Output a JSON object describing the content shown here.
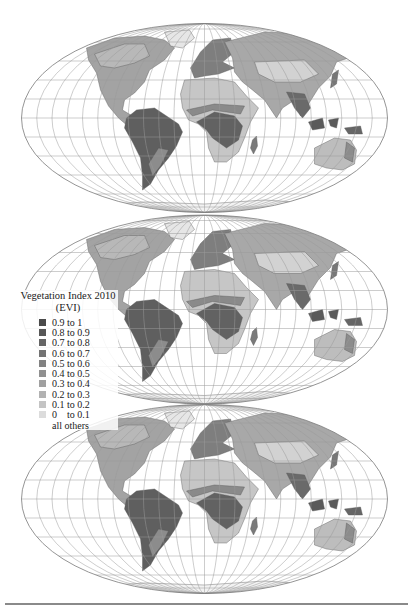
{
  "figure": {
    "maps": [
      {
        "id": "map-1",
        "cx": 204.5,
        "cy": 118,
        "rx": 183,
        "ry": 94
      },
      {
        "id": "map-2",
        "cx": 204.5,
        "cy": 309.5,
        "rx": 183,
        "ry": 95
      },
      {
        "id": "map-3",
        "cx": 204.5,
        "cy": 499,
        "rx": 183,
        "ry": 94
      }
    ],
    "graticule_spacing_degrees": 15
  },
  "legend": {
    "title": "Vegetation Index 2010",
    "subtitle": "(EVI)",
    "items": [
      {
        "label": "0.9 to 1",
        "color": "#4a4a4a"
      },
      {
        "label": "0.8 to 0.9",
        "color": "#575757"
      },
      {
        "label": "0.7 to 0.8",
        "color": "#656565"
      },
      {
        "label": "0.6 to 0.7",
        "color": "#737373"
      },
      {
        "label": "0.5 to 0.6",
        "color": "#828282"
      },
      {
        "label": "0.4 to 0.5",
        "color": "#909090"
      },
      {
        "label": "0.3 to 0.4",
        "color": "#a0a0a0"
      },
      {
        "label": "0.2 to 0.3",
        "color": "#b2b2b2"
      },
      {
        "label": "0.1 to 0.2",
        "color": "#c4c4c4"
      },
      {
        "label": "0    to 0.1",
        "color": "#dcdcdc"
      }
    ],
    "others_label": "all others"
  },
  "colors": {
    "graticule": "#9a9a9a",
    "rule": "#8a8a8a",
    "background": "#ffffff"
  }
}
